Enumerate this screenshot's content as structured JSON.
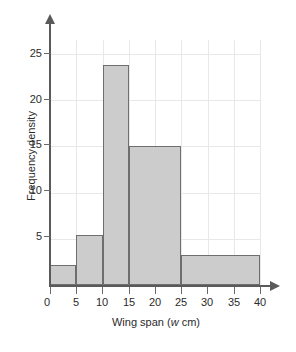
{
  "chart_data": {
    "type": "bar",
    "title": "",
    "xlabel": "Wing span (w cm)",
    "xlabel_prefix": "Wing span (",
    "xlabel_variable": "w",
    "xlabel_suffix": " cm)",
    "ylabel": "Frequency density",
    "xlim": [
      0,
      40
    ],
    "ylim": [
      0,
      26.5
    ],
    "grid": true,
    "legend": null,
    "xticks": [
      0,
      5,
      10,
      15,
      20,
      25,
      30,
      35,
      40
    ],
    "yticks": [
      5,
      10,
      15,
      20,
      25
    ],
    "bin_edges": [
      0,
      5,
      10,
      15,
      25,
      40
    ],
    "categories": [
      "0-5",
      "5-10",
      "10-15",
      "15-25",
      "25-40"
    ],
    "values": [
      2.2,
      5.4,
      23.8,
      15,
      3.3
    ],
    "bars": [
      {
        "label": "0-5",
        "start": 0,
        "end": 5,
        "density": 2.2
      },
      {
        "label": "5-10",
        "start": 5,
        "end": 10,
        "density": 5.4
      },
      {
        "label": "10-15",
        "start": 10,
        "end": 15,
        "density": 23.8
      },
      {
        "label": "15-25",
        "start": 15,
        "end": 25,
        "density": 15
      },
      {
        "label": "25-40",
        "start": 25,
        "end": 40,
        "density": 3.3
      }
    ],
    "colors": {
      "bar_fill": "#cccccc",
      "bar_stroke": "#6e6e6e",
      "axis": "#5a5a5a",
      "grid": "#e8e8e8",
      "text": "#2b2b2b",
      "background": "#ffffff"
    }
  }
}
